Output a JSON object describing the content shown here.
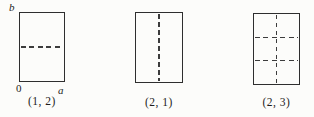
{
  "figure": {
    "description_colors": {
      "line_color": "#2e2e2e",
      "dashed_line_color": "#3c3c3c",
      "text_color": "#1c1c1c",
      "background": "#fcfcfa"
    },
    "panels": [
      {
        "caption": "(1, 2)",
        "grid": {
          "cols": 1,
          "rows": 2
        },
        "axis_labels": {
          "height": "b",
          "origin": "0",
          "width": "a"
        }
      },
      {
        "caption": "(2, 1)",
        "grid": {
          "cols": 2,
          "rows": 1
        }
      },
      {
        "caption": "(2, 3)",
        "grid": {
          "cols": 2,
          "rows": 3
        }
      }
    ]
  }
}
